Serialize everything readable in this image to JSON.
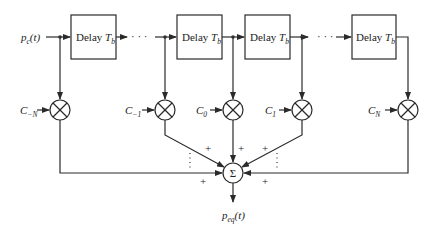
{
  "diagram": {
    "input": {
      "label": "p",
      "sub": "c",
      "arg": "(t)"
    },
    "output": {
      "label": "p",
      "sub": "eq",
      "arg": "(t)"
    },
    "delay_blocks": [
      {
        "label": "Delay",
        "var": "T",
        "sub": "b"
      },
      {
        "label": "Delay",
        "var": "T",
        "sub": "b"
      },
      {
        "label": "Delay",
        "var": "T",
        "sub": "b"
      },
      {
        "label": "Delay",
        "var": "T",
        "sub": "b"
      }
    ],
    "ellipsis": "· · ·",
    "taps": [
      {
        "coef": "C",
        "sub": "−N"
      },
      {
        "coef": "C",
        "sub": "−1"
      },
      {
        "coef": "C",
        "sub": "0"
      },
      {
        "coef": "C",
        "sub": "1"
      },
      {
        "coef": "C",
        "sub": "N"
      }
    ],
    "summer": {
      "symbol": "Σ"
    },
    "plus_sign": "+",
    "colors": {
      "line": "#2a2a2a",
      "background": "#ffffff"
    }
  }
}
